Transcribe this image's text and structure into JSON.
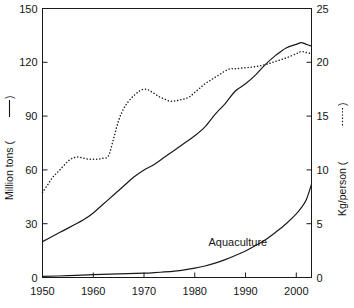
{
  "chart_data": {
    "type": "line",
    "title": "",
    "xlabel": "",
    "ylabel": "Million tons (——)",
    "ylabel_right": "Kg/person (·····)",
    "xlim": [
      1950,
      2003
    ],
    "ylim": [
      0,
      150
    ],
    "ylim_right": [
      0,
      25
    ],
    "grid": false,
    "legend": "inline-annotation",
    "xticks": [
      1950,
      1960,
      1970,
      1980,
      1990,
      2000
    ],
    "xtick_labels": [
      "1950",
      "1960",
      "1970",
      "1980",
      "1990",
      "2000"
    ],
    "yticks": [
      0,
      30,
      60,
      90,
      120,
      150
    ],
    "ytick_labels": [
      "0",
      "30",
      "60",
      "90",
      "120",
      "150"
    ],
    "yticks_right": [
      0,
      5,
      10,
      15,
      20,
      25
    ],
    "ytick_labels_right": [
      "0",
      "5",
      "10",
      "15",
      "20",
      "25"
    ],
    "annotations": [
      {
        "text": "Aquaculture",
        "x": 1988.5,
        "y": 17.5,
        "axis": "left"
      }
    ],
    "series": [
      {
        "name": "Total production",
        "style": "solid",
        "axis": "left",
        "unit": "Million tons",
        "x": [
          1950,
          1952,
          1954,
          1956,
          1958,
          1960,
          1962,
          1964,
          1966,
          1968,
          1970,
          1972,
          1974,
          1976,
          1978,
          1980,
          1982,
          1984,
          1986,
          1988,
          1990,
          1992,
          1994,
          1996,
          1998,
          2000,
          2001,
          2002,
          2003
        ],
        "values": [
          20,
          23,
          26,
          29,
          32,
          36,
          41,
          46,
          51,
          56,
          60,
          63,
          67,
          71,
          75,
          79,
          84,
          91,
          97,
          104,
          108,
          113,
          119,
          124,
          128,
          130,
          131,
          130,
          129
        ]
      },
      {
        "name": "Aquaculture",
        "style": "solid",
        "axis": "left",
        "unit": "Million tons",
        "x": [
          1950,
          1955,
          1960,
          1965,
          1970,
          1972,
          1974,
          1976,
          1978,
          1980,
          1982,
          1984,
          1986,
          1988,
          1990,
          1992,
          1994,
          1996,
          1998,
          2000,
          2001,
          2002,
          2003
        ],
        "values": [
          0.6,
          1.0,
          1.6,
          2.0,
          2.4,
          2.7,
          3.1,
          3.6,
          4.3,
          5.2,
          6.4,
          8.0,
          10.0,
          12.3,
          14.8,
          17.8,
          21.2,
          25.4,
          30.0,
          35.5,
          39.0,
          43.5,
          52.0
        ]
      },
      {
        "name": "Per capita supply",
        "style": "dotted",
        "axis": "right",
        "unit": "Kg/person",
        "x": [
          1950,
          1951,
          1952,
          1953,
          1954,
          1955,
          1956,
          1957,
          1958,
          1959,
          1960,
          1961,
          1962,
          1963,
          1964,
          1965,
          1966,
          1967,
          1968,
          1969,
          1970,
          1971,
          1972,
          1973,
          1974,
          1975,
          1976,
          1977,
          1978,
          1979,
          1980,
          1981,
          1982,
          1983,
          1984,
          1985,
          1986,
          1987,
          1988,
          1990,
          1992,
          1994,
          1996,
          1998,
          2000,
          2001,
          2002,
          2003
        ],
        "values": [
          7.9,
          8.6,
          9.3,
          9.8,
          10.3,
          10.8,
          11.1,
          11.2,
          11.1,
          11.0,
          11.0,
          11.0,
          11.1,
          11.3,
          12.9,
          14.6,
          15.7,
          16.4,
          16.9,
          17.3,
          17.5,
          17.4,
          17.1,
          16.8,
          16.6,
          16.4,
          16.4,
          16.5,
          16.6,
          16.8,
          17.2,
          17.6,
          18.0,
          18.3,
          18.6,
          18.9,
          19.2,
          19.4,
          19.4,
          19.5,
          19.6,
          19.8,
          20.1,
          20.4,
          20.8,
          21.0,
          20.9,
          20.8
        ]
      }
    ]
  },
  "axes": {
    "left_title": "Million tons (——)",
    "right_title": "Kg/person (·····)"
  },
  "labels": {
    "aquaculture": "Aquaculture"
  }
}
